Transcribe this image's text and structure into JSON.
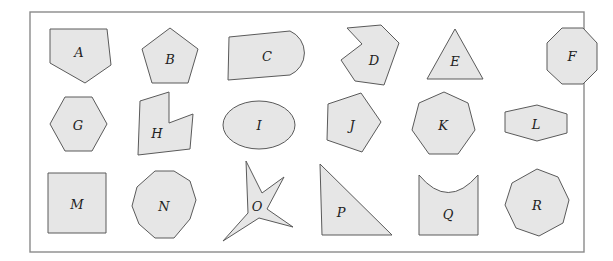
{
  "figure": {
    "shapes": [
      {
        "label": "A",
        "kind": "irregular pentagon"
      },
      {
        "label": "B",
        "kind": "regular pentagon"
      },
      {
        "label": "C",
        "kind": "quadrilateral with rounded end"
      },
      {
        "label": "D",
        "kind": "concave heptagon"
      },
      {
        "label": "E",
        "kind": "equilateral triangle"
      },
      {
        "label": "F",
        "kind": "regular octagon"
      },
      {
        "label": "G",
        "kind": "regular hexagon"
      },
      {
        "label": "H",
        "kind": "concave hexagon"
      },
      {
        "label": "I",
        "kind": "ellipse"
      },
      {
        "label": "J",
        "kind": "irregular pentagon"
      },
      {
        "label": "K",
        "kind": "regular heptagon"
      },
      {
        "label": "L",
        "kind": "elongated hexagon"
      },
      {
        "label": "M",
        "kind": "square"
      },
      {
        "label": "N",
        "kind": "regular decagon"
      },
      {
        "label": "O",
        "kind": "four-pointed star"
      },
      {
        "label": "P",
        "kind": "right triangle"
      },
      {
        "label": "Q",
        "kind": "shape with curved top"
      },
      {
        "label": "R",
        "kind": "regular nonagon"
      }
    ]
  },
  "colors": {
    "fill": "#e6e6e6",
    "stroke": "#5a5a5a",
    "frame": "#8a8a8a"
  }
}
